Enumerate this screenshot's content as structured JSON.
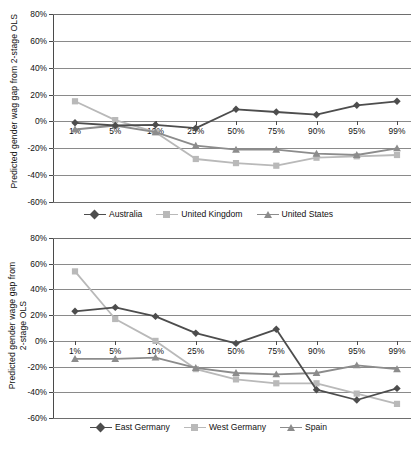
{
  "colors": {
    "series_dark": "#4d4d4d",
    "series_light": "#b9b9b9",
    "series_mid": "#8c8c8c",
    "gridline": "#6e6e6e",
    "axis": "#4a4a4a",
    "text": "#111111",
    "background": "#ffffff"
  },
  "charts": [
    {
      "id": "top",
      "ylabel": "Predicted gender wag gap from 2-stage OLS",
      "ylabel_lines": [
        "Predicted gender wag gap from 2-stage OLS"
      ],
      "yticks": [
        "80%",
        "60%",
        "40%",
        "20%",
        "0%",
        "-20%",
        "-40%",
        "-60%"
      ],
      "xticks": [
        "1%",
        "5%",
        "10%",
        "25%",
        "50%",
        "75%",
        "90%",
        "95%",
        "99%"
      ],
      "legend": [
        {
          "label": "Australia",
          "marker": "diamond",
          "color": "#4d4d4d"
        },
        {
          "label": "United Kingdom",
          "marker": "square",
          "color": "#b9b9b9"
        },
        {
          "label": "United States",
          "marker": "triangle",
          "color": "#8c8c8c"
        }
      ]
    },
    {
      "id": "bottom",
      "ylabel": "Predicted gender wage gap from 2-stage OLS",
      "ylabel_lines": [
        "Predicted gender wage gap from",
        "2-stage OLS"
      ],
      "yticks": [
        "80%",
        "60%",
        "40%",
        "20%",
        "0%",
        "-20%",
        "-40%",
        "-60%"
      ],
      "xticks": [
        "1%",
        "5%",
        "10%",
        "25%",
        "50%",
        "75%",
        "90%",
        "95%",
        "99%"
      ],
      "legend": [
        {
          "label": "East Germany",
          "marker": "diamond",
          "color": "#4d4d4d"
        },
        {
          "label": "West Germany",
          "marker": "square",
          "color": "#b9b9b9"
        },
        {
          "label": "Spain",
          "marker": "triangle",
          "color": "#8c8c8c"
        }
      ]
    }
  ],
  "chart_data": [
    {
      "type": "line",
      "id": "top",
      "title": "",
      "xlabel": "",
      "ylabel": "Predicted gender wag gap from 2-stage OLS",
      "categories": [
        "1%",
        "5%",
        "10%",
        "25%",
        "50%",
        "75%",
        "90%",
        "95%",
        "99%"
      ],
      "ylim": [
        -60,
        80
      ],
      "ytick_step": 20,
      "grid": true,
      "legend_position": "bottom",
      "units": "percent",
      "series": [
        {
          "name": "Australia",
          "marker": "diamond",
          "color": "#4d4d4d",
          "values": [
            -1,
            -3,
            -2.5,
            -5,
            9,
            7,
            5,
            12,
            15
          ]
        },
        {
          "name": "United Kingdom",
          "marker": "square",
          "color": "#b9b9b9",
          "values": [
            15,
            1,
            -8,
            -28,
            -31,
            -33,
            -27,
            -26,
            -25
          ]
        },
        {
          "name": "United States",
          "marker": "triangle",
          "color": "#8c8c8c",
          "values": [
            -6,
            -3,
            -8,
            -18,
            -21,
            -21,
            -24,
            -25,
            -20
          ]
        }
      ]
    },
    {
      "type": "line",
      "id": "bottom",
      "title": "",
      "xlabel": "",
      "ylabel": "Predicted gender wage gap from 2-stage OLS",
      "categories": [
        "1%",
        "5%",
        "10%",
        "25%",
        "50%",
        "75%",
        "90%",
        "95%",
        "99%"
      ],
      "ylim": [
        -60,
        80
      ],
      "ytick_step": 20,
      "grid": true,
      "legend_position": "bottom",
      "units": "percent",
      "series": [
        {
          "name": "East Germany",
          "marker": "diamond",
          "color": "#4d4d4d",
          "values": [
            23,
            26,
            19,
            6,
            -2,
            9,
            -38,
            -46,
            -37
          ]
        },
        {
          "name": "West Germany",
          "marker": "square",
          "color": "#b9b9b9",
          "values": [
            54,
            17,
            0,
            -22,
            -30,
            -33,
            -33,
            -41,
            -49
          ]
        },
        {
          "name": "Spain",
          "marker": "triangle",
          "color": "#8c8c8c",
          "values": [
            -14,
            -14,
            -13,
            -21,
            -25,
            -26,
            -25,
            -19,
            -22
          ]
        }
      ]
    }
  ]
}
